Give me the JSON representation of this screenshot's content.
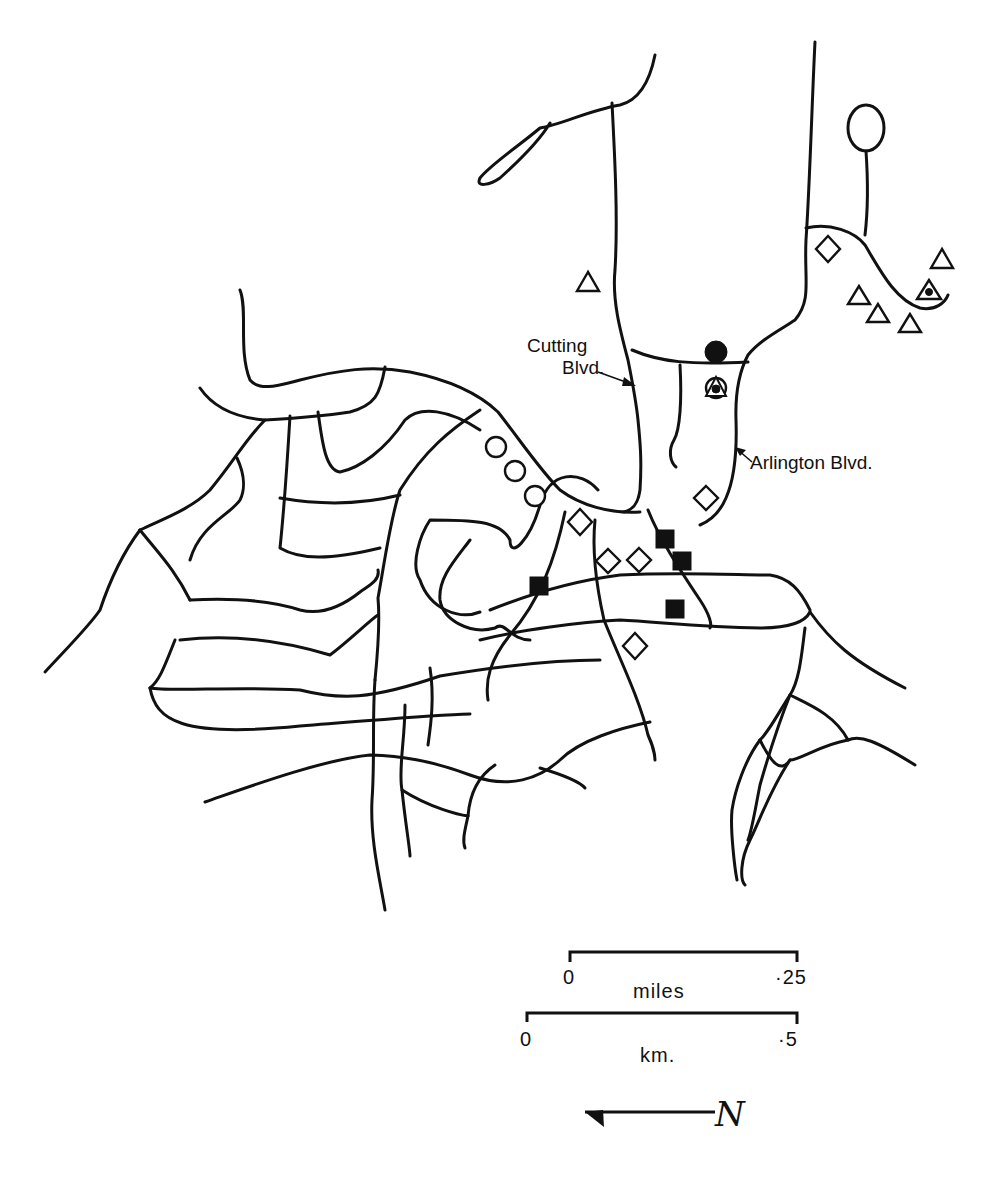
{
  "map": {
    "labels": {
      "cutting_line1": "Cutting",
      "cutting_line2": "Blvd.",
      "arlington": "Arlington Blvd."
    },
    "symbols": {
      "open_triangles": 7,
      "triangle_with_dot": 1,
      "open_diamonds": 7,
      "filled_squares": 4,
      "open_circles": 3,
      "filled_circle": 1,
      "circled_triangle_with_dot": 1
    },
    "scale": {
      "miles": {
        "start": "0",
        "end": "·25",
        "unit": "miles"
      },
      "km": {
        "start": "0",
        "end": "·5",
        "unit": "km."
      }
    },
    "north_arrow": {
      "label": "N"
    },
    "colors": {
      "ink": "#111111",
      "background": "#ffffff"
    }
  }
}
